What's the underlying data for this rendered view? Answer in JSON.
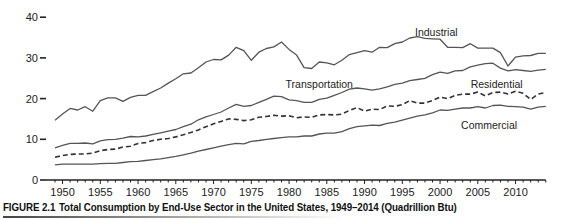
{
  "caption": {
    "figure_label": "FIGURE 2.1",
    "text": "Total Consumption by End-Use Sector in the United States, 1949–2014 (Quadrillion Btu)"
  },
  "chart_data": {
    "type": "line",
    "title": "Total Consumption by End-Use Sector in the United States, 1949–2014 (Quadrillion Btu)",
    "xlabel": "",
    "ylabel": "",
    "xlim": [
      1949,
      2014
    ],
    "ylim": [
      0,
      40
    ],
    "grid": false,
    "legend_position": "inline labels",
    "y_ticks": [
      "0",
      "10",
      "20",
      "30",
      "40"
    ],
    "x_ticks": [
      "1950",
      "1955",
      "1960",
      "1965",
      "1970",
      "1975",
      "1980",
      "1985",
      "1990",
      "1995",
      "2000",
      "2005",
      "2010"
    ],
    "x": [
      1949,
      1950,
      1951,
      1952,
      1953,
      1954,
      1955,
      1956,
      1957,
      1958,
      1959,
      1960,
      1961,
      1962,
      1963,
      1964,
      1965,
      1966,
      1967,
      1968,
      1969,
      1970,
      1971,
      1972,
      1973,
      1974,
      1975,
      1976,
      1977,
      1978,
      1979,
      1980,
      1981,
      1982,
      1983,
      1984,
      1985,
      1986,
      1987,
      1988,
      1989,
      1990,
      1991,
      1992,
      1993,
      1994,
      1995,
      1996,
      1997,
      1998,
      1999,
      2000,
      2001,
      2002,
      2003,
      2004,
      2005,
      2006,
      2007,
      2008,
      2009,
      2010,
      2011,
      2012,
      2013,
      2014
    ],
    "series": [
      {
        "name": "Industrial",
        "style": "solid",
        "label_pos": [
          1999.5,
          35.5
        ],
        "values": [
          14.7,
          16.2,
          17.6,
          17.2,
          18.0,
          16.9,
          19.5,
          20.2,
          20.2,
          19.3,
          20.3,
          20.8,
          20.8,
          21.7,
          22.6,
          23.8,
          24.9,
          26.1,
          26.3,
          27.6,
          29.0,
          29.6,
          29.5,
          30.7,
          32.6,
          31.8,
          29.4,
          31.4,
          32.3,
          32.7,
          33.9,
          32.1,
          30.7,
          27.6,
          27.4,
          29.0,
          28.8,
          28.3,
          29.4,
          30.8,
          31.3,
          31.8,
          31.4,
          32.6,
          32.5,
          33.5,
          33.9,
          34.9,
          35.2,
          34.8,
          34.7,
          34.6,
          32.6,
          32.6,
          32.5,
          33.5,
          32.4,
          32.4,
          32.4,
          31.3,
          28.0,
          30.2,
          30.5,
          30.6,
          31.1,
          31.1
        ]
      },
      {
        "name": "Transportation",
        "style": "solid",
        "label_pos": [
          1984,
          22.5
        ],
        "values": [
          7.9,
          8.5,
          9.0,
          9.0,
          9.1,
          8.9,
          9.6,
          9.9,
          10.0,
          10.3,
          10.7,
          10.6,
          10.8,
          11.2,
          11.6,
          12.0,
          12.4,
          13.1,
          13.7,
          14.8,
          15.5,
          16.1,
          16.7,
          17.7,
          18.6,
          18.1,
          18.3,
          19.1,
          19.8,
          20.6,
          20.5,
          19.7,
          19.5,
          19.1,
          19.1,
          19.8,
          20.1,
          20.8,
          21.5,
          22.3,
          22.6,
          22.4,
          22.1,
          22.4,
          22.9,
          23.5,
          23.8,
          24.4,
          24.7,
          25.0,
          25.9,
          26.5,
          26.2,
          26.8,
          26.9,
          27.8,
          28.2,
          28.6,
          28.7,
          27.5,
          26.8,
          27.1,
          26.9,
          26.7,
          27.0,
          27.2
        ]
      },
      {
        "name": "Residential",
        "style": "dashed",
        "label_pos": [
          2007.5,
          22.6
        ],
        "values": [
          5.6,
          6.0,
          6.3,
          6.4,
          6.4,
          6.6,
          7.2,
          7.5,
          7.6,
          8.1,
          8.3,
          9.0,
          9.2,
          9.7,
          10.0,
          10.2,
          10.6,
          11.1,
          11.7,
          12.3,
          13.1,
          13.8,
          14.4,
          15.0,
          14.9,
          14.6,
          14.8,
          15.4,
          15.6,
          15.9,
          15.7,
          15.8,
          15.3,
          15.5,
          15.4,
          16.0,
          16.1,
          16.0,
          16.2,
          17.1,
          17.8,
          16.9,
          17.4,
          17.3,
          18.2,
          18.1,
          18.5,
          19.5,
          18.9,
          18.9,
          19.5,
          20.4,
          20.0,
          20.8,
          21.1,
          21.1,
          21.6,
          20.7,
          21.5,
          21.6,
          21.1,
          21.8,
          21.3,
          19.8,
          21.1,
          21.5
        ]
      },
      {
        "name": "Commercial",
        "style": "solid",
        "label_pos": [
          2006.5,
          12.6
        ],
        "values": [
          3.7,
          3.9,
          3.9,
          3.9,
          3.9,
          3.9,
          4.0,
          4.1,
          4.1,
          4.3,
          4.5,
          4.6,
          4.8,
          5.0,
          5.2,
          5.5,
          5.8,
          6.2,
          6.6,
          7.1,
          7.5,
          7.9,
          8.3,
          8.7,
          9.0,
          8.9,
          9.5,
          9.7,
          10.0,
          10.2,
          10.4,
          10.6,
          10.6,
          10.8,
          10.8,
          11.3,
          11.5,
          11.5,
          11.9,
          12.6,
          13.1,
          13.3,
          13.5,
          13.4,
          13.9,
          14.2,
          14.7,
          15.2,
          15.7,
          16.0,
          16.5,
          17.2,
          17.1,
          17.4,
          17.7,
          17.7,
          18.0,
          17.7,
          18.3,
          18.4,
          18.1,
          18.0,
          17.9,
          17.4,
          17.9,
          18.1
        ]
      }
    ]
  }
}
